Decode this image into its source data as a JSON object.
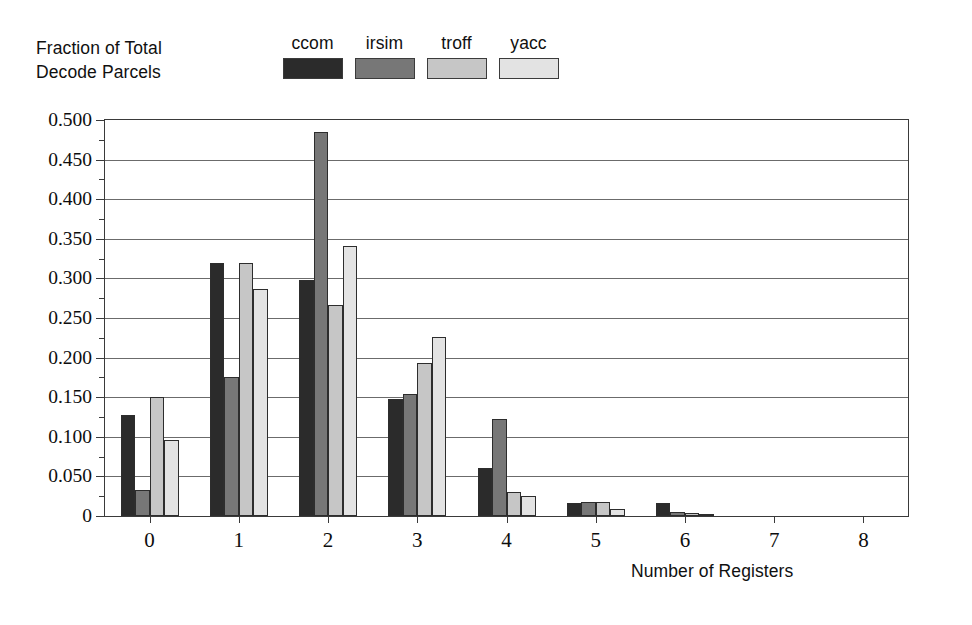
{
  "chart_data": {
    "type": "bar",
    "title": "",
    "ylabel": "Fraction of Total\nDecode Parcels",
    "xlabel": "Number of Registers",
    "categories": [
      "0",
      "1",
      "2",
      "3",
      "4",
      "5",
      "6",
      "7",
      "8"
    ],
    "series": [
      {
        "name": "ccom",
        "color": "#2b2b2b",
        "values": [
          0.127,
          0.32,
          0.298,
          0.148,
          0.061,
          0.016,
          0.016,
          0.0,
          0.0
        ]
      },
      {
        "name": "irsim",
        "color": "#777777",
        "values": [
          0.033,
          0.175,
          0.485,
          0.154,
          0.123,
          0.018,
          0.005,
          0.0,
          0.0
        ]
      },
      {
        "name": "troff",
        "color": "#c6c6c6",
        "values": [
          0.15,
          0.32,
          0.267,
          0.193,
          0.03,
          0.018,
          0.004,
          0.0,
          0.0
        ]
      },
      {
        "name": "yacc",
        "color": "#e3e3e3",
        "values": [
          0.096,
          0.287,
          0.341,
          0.226,
          0.025,
          0.009,
          0.002,
          0.0,
          0.0
        ]
      }
    ],
    "ylim": [
      0,
      0.5
    ],
    "ytick_labels": [
      "0",
      "0.050",
      "0.100",
      "0.150",
      "0.200",
      "0.250",
      "0.300",
      "0.350",
      "0.400",
      "0.450",
      "0.500"
    ],
    "ytick_values": [
      0,
      0.05,
      0.1,
      0.15,
      0.2,
      0.25,
      0.3,
      0.35,
      0.4,
      0.45,
      0.5
    ],
    "yminor_step": 0.025,
    "grid": true,
    "legend_position": "top-center",
    "xlim": [
      -0.5,
      8.5
    ]
  },
  "legend": {
    "entries": [
      {
        "label": "ccom"
      },
      {
        "label": "irsim"
      },
      {
        "label": "troff"
      },
      {
        "label": "yacc"
      }
    ]
  },
  "axes": {
    "y_title": "Fraction of Total\nDecode Parcels",
    "x_title": "Number of Registers"
  }
}
